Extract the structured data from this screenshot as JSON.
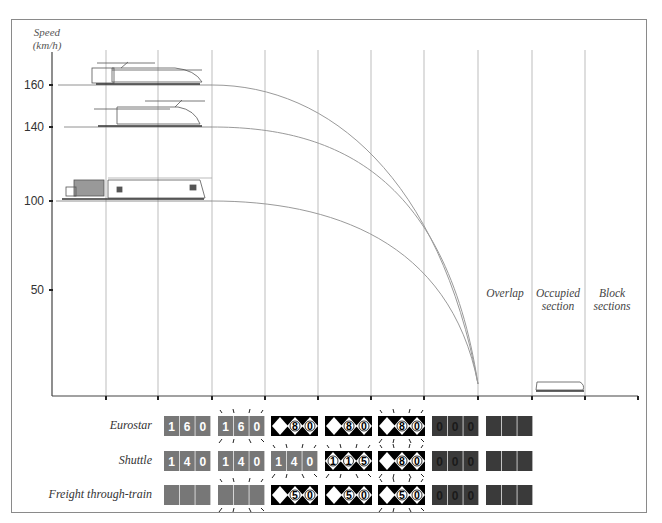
{
  "diagram": {
    "y_axis_title_line1": "Speed",
    "y_axis_title_line2": "(km/h)",
    "y_ticks": [
      {
        "label": "160",
        "value": 160
      },
      {
        "label": "140",
        "value": 140
      },
      {
        "label": "100",
        "value": 100
      },
      {
        "label": "50",
        "value": 50
      }
    ],
    "section_labels": {
      "overlap": "Overlap",
      "occupied_line1": "Occupied",
      "occupied_line2": "section",
      "block_line1": "Block",
      "block_line2": "sections"
    },
    "trains": [
      {
        "name": "Eurostar",
        "initial_speed": 160
      },
      {
        "name": "Shuttle",
        "initial_speed": 140
      },
      {
        "name": "Freight through-train",
        "initial_speed": 100
      }
    ],
    "braking_curves": [
      {
        "train": "Eurostar",
        "from_speed": 160,
        "to_speed": 0
      },
      {
        "train": "Shuttle",
        "from_speed": 140,
        "to_speed": 0
      },
      {
        "train": "Freight through-train",
        "from_speed": 100,
        "to_speed": 0
      }
    ]
  },
  "signals": {
    "rows": [
      {
        "label": "Eurostar",
        "panels": [
          {
            "type": "grey",
            "digits": [
              "1",
              "6",
              "0"
            ],
            "flashing": false
          },
          {
            "type": "grey",
            "digits": [
              "1",
              "6",
              "0"
            ],
            "flashing": true
          },
          {
            "type": "black",
            "digits": [
              "8",
              "0"
            ],
            "flashing": false
          },
          {
            "type": "black",
            "digits": [
              "8",
              "0"
            ],
            "flashing": false
          },
          {
            "type": "black",
            "digits": [
              "8",
              "0"
            ],
            "flashing": true
          },
          {
            "type": "dark",
            "digits": [
              "0",
              "0",
              "0"
            ],
            "flashing": false
          },
          {
            "type": "dark",
            "digits": [
              "",
              "",
              ""
            ],
            "flashing": false
          }
        ]
      },
      {
        "label": "Shuttle",
        "panels": [
          {
            "type": "grey",
            "digits": [
              "1",
              "4",
              "0"
            ],
            "flashing": false
          },
          {
            "type": "grey",
            "digits": [
              "1",
              "4",
              "0"
            ],
            "flashing": false
          },
          {
            "type": "grey",
            "digits": [
              "1",
              "4",
              "0"
            ],
            "flashing": true
          },
          {
            "type": "black3",
            "digits": [
              "1",
              "1",
              "5"
            ],
            "flashing": true
          },
          {
            "type": "black",
            "digits": [
              "8",
              "0"
            ],
            "flashing": true
          },
          {
            "type": "dark",
            "digits": [
              "0",
              "0",
              "0"
            ],
            "flashing": false
          },
          {
            "type": "dark",
            "digits": [
              "",
              "",
              ""
            ],
            "flashing": false
          }
        ]
      },
      {
        "label": "Freight through-train",
        "panels": [
          {
            "type": "grey",
            "digits": [
              "",
              "",
              ""
            ],
            "flashing": false
          },
          {
            "type": "grey",
            "digits": [
              "",
              "",
              ""
            ],
            "flashing": true
          },
          {
            "type": "black",
            "digits": [
              "5",
              "0"
            ],
            "flashing": false
          },
          {
            "type": "black",
            "digits": [
              "5",
              "0"
            ],
            "flashing": false
          },
          {
            "type": "black",
            "digits": [
              "5",
              "0"
            ],
            "flashing": true
          },
          {
            "type": "dark",
            "digits": [
              "0",
              "0",
              "0"
            ],
            "flashing": false
          },
          {
            "type": "dark",
            "digits": [
              "",
              "",
              ""
            ],
            "flashing": false
          }
        ]
      }
    ]
  },
  "colors": {
    "grey_panel": "#777777",
    "dark_panel": "#3a3a3a",
    "black_panel": "#000000",
    "grid": "#b8b8b8",
    "curve": "#9a9a9a",
    "axis": "#444444"
  }
}
